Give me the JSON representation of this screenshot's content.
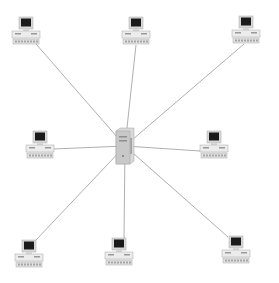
{
  "diagram": {
    "title": "Star network topology",
    "type": "star",
    "colors": {
      "background": "#ffffff",
      "link": "#9a9a9a",
      "screen": "#1a1a1a",
      "bezel": "#d8d8d8",
      "case": "#ececec",
      "case_outline": "#a8a8a8",
      "server": "#c8c8c8"
    },
    "hub": {
      "name": "server",
      "icon": "server-tower-icon",
      "x": 116,
      "y": 128,
      "w": 18,
      "h": 36,
      "center": [
        125,
        146
      ]
    },
    "nodes": [
      {
        "name": "workstation-top-left",
        "icon": "desktop-computer-icon",
        "x": 12,
        "y": 17,
        "link_to": [
          36,
          44
        ]
      },
      {
        "name": "workstation-top-center",
        "icon": "desktop-computer-icon",
        "x": 122,
        "y": 17,
        "link_to": [
          136,
          45
        ]
      },
      {
        "name": "workstation-top-right",
        "icon": "desktop-computer-icon",
        "x": 232,
        "y": 16,
        "link_to": [
          244,
          44
        ]
      },
      {
        "name": "workstation-middle-left",
        "icon": "desktop-computer-icon",
        "x": 26,
        "y": 131,
        "link_to": [
          53,
          149
        ]
      },
      {
        "name": "workstation-middle-right",
        "icon": "desktop-computer-icon",
        "x": 200,
        "y": 131,
        "link_to": [
          200,
          151
        ]
      },
      {
        "name": "workstation-bottom-left",
        "icon": "desktop-computer-icon",
        "x": 15,
        "y": 240,
        "link_to": [
          36,
          240
        ]
      },
      {
        "name": "workstation-bottom-center",
        "icon": "desktop-computer-icon",
        "x": 105,
        "y": 238,
        "link_to": [
          124,
          238
        ]
      },
      {
        "name": "workstation-bottom-right",
        "icon": "desktop-computer-icon",
        "x": 222,
        "y": 236,
        "link_to": [
          228,
          237
        ]
      }
    ]
  }
}
